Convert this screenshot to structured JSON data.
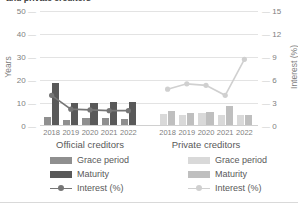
{
  "chart_data": {
    "type": "bar",
    "title": "and private creditors",
    "title_clipped": true,
    "categories": [
      "2018",
      "2019",
      "2020",
      "2021",
      "2022"
    ],
    "groups": [
      {
        "name": "Official creditors",
        "series": [
          {
            "name": "Grace period",
            "axis": "left",
            "color": "#8f8f8f",
            "values": [
              4.0,
              2.7,
              3.3,
              3.5,
              3.0
            ]
          },
          {
            "name": "Maturity",
            "axis": "left",
            "color": "#595959",
            "values": [
              18.5,
              10.0,
              10.2,
              10.3,
              10.4
            ]
          },
          {
            "name": "Interest (%)",
            "axis": "right",
            "color": "#767676",
            "values": [
              4.0,
              2.2,
              2.1,
              2.0,
              2.0
            ]
          }
        ]
      },
      {
        "name": "Private creditors",
        "series": [
          {
            "name": "Grace period",
            "axis": "left",
            "color": "#d9d9d9",
            "values": [
              5.4,
              5.0,
              5.5,
              4.9,
              4.6
            ]
          },
          {
            "name": "Maturity",
            "axis": "left",
            "color": "#bfbfbf",
            "values": [
              6.4,
              5.6,
              6.2,
              8.6,
              4.7
            ]
          },
          {
            "name": "Interest (%)",
            "axis": "right",
            "color": "#d0d0d0",
            "values": [
              4.8,
              5.5,
              5.3,
              4.0,
              8.7
            ]
          }
        ]
      }
    ],
    "ylabel": "Years",
    "y2label": "Interest (%)",
    "xlabel": "",
    "ylim": [
      0,
      50
    ],
    "y2lim": [
      0,
      15
    ],
    "yticks": [
      "0",
      "10",
      "20",
      "30",
      "40",
      "50"
    ],
    "y2ticks": [
      "0",
      "3",
      "6",
      "9",
      "12",
      "15"
    ],
    "grid": true,
    "legend_position": "bottom"
  },
  "legends": {
    "official": {
      "grace": "Grace period",
      "maturity": "Maturity",
      "interest": "Interest (%)"
    },
    "private": {
      "grace": "Grace period",
      "maturity": "Maturity",
      "interest": "Interest (%)"
    }
  }
}
